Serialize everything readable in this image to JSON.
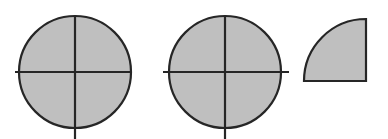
{
  "figure": {
    "description": "Three shaded geometric figures: two circles each divided into four equal quarters by a vertical and a horizontal diameter, and one shaded quarter-circle sector.",
    "background_color": "#ffffff",
    "fill_color": "#bfbfbf",
    "outline_color": "#262626",
    "stroke_width": 2.2,
    "canvas": {
      "width": 388,
      "height": 139
    }
  },
  "shapes": [
    {
      "id": "circle-left",
      "name": "Whole circle divided into fourths",
      "type": "circle",
      "label": "",
      "parts_total": 4,
      "parts_shaded": 4,
      "fraction": "4/4",
      "center": {
        "x": 75,
        "y": 72
      },
      "radius": 56,
      "dividers": [
        {
          "orientation": "vertical",
          "x": 75,
          "y1": 15,
          "y2": 139
        },
        {
          "orientation": "horizontal",
          "y": 72,
          "x1": 15,
          "x2": 131
        }
      ]
    },
    {
      "id": "circle-middle",
      "name": "Whole circle divided into fourths",
      "type": "circle",
      "label": "",
      "parts_total": 4,
      "parts_shaded": 4,
      "fraction": "4/4",
      "center": {
        "x": 225,
        "y": 72
      },
      "radius": 56,
      "dividers": [
        {
          "orientation": "vertical",
          "x": 225,
          "y1": 15,
          "y2": 139
        },
        {
          "orientation": "horizontal",
          "y": 72,
          "x1": 163,
          "x2": 289
        }
      ]
    },
    {
      "id": "quarter-circle-right",
      "name": "Quarter circle sector",
      "type": "quarter-circle",
      "label": "",
      "parts_total": 4,
      "parts_shaded": 1,
      "fraction": "1/4",
      "corner": {
        "x": 366,
        "y": 81
      },
      "radius": 62,
      "arc_from": {
        "x": 366,
        "y": 19
      },
      "arc_to": {
        "x": 304,
        "y": 81
      },
      "sweep": "upper-left arc, flat right edge, flat bottom edge"
    }
  ],
  "chart_data": {
    "type": "pie",
    "xlabel": "",
    "ylabel": "",
    "categories": [
      "Circle 1",
      "Circle 2",
      "Quarter sector"
    ],
    "values": [
      4,
      4,
      1
    ],
    "series": [
      {
        "name": "Shaded parts",
        "values": [
          4,
          4,
          1
        ]
      },
      {
        "name": "Total parts",
        "values": [
          4,
          4,
          4
        ]
      }
    ],
    "annotations": [
      "Circle 1: 4 of 4 quarters shaded",
      "Circle 2: 4 of 4 quarters shaded",
      "Sector: 1 of 4 quarters shaded"
    ],
    "legend_position": "none",
    "grid": false
  }
}
